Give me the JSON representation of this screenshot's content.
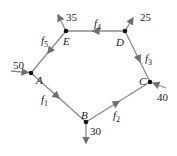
{
  "diagram": {
    "type": "flow-network",
    "nodes": [
      {
        "id": "A",
        "label": "A"
      },
      {
        "id": "B",
        "label": "B"
      },
      {
        "id": "C",
        "label": "C"
      },
      {
        "id": "D",
        "label": "D"
      },
      {
        "id": "E",
        "label": "E"
      }
    ],
    "edges": [
      {
        "from": "A",
        "to": "B",
        "label": "f",
        "sub": "1"
      },
      {
        "from": "B",
        "to": "C",
        "label": "f",
        "sub": "2"
      },
      {
        "from": "D",
        "to": "C",
        "label": "f",
        "sub": "3"
      },
      {
        "from": "D",
        "to": "E",
        "label": "f",
        "sub": "4"
      },
      {
        "from": "E",
        "to": "A",
        "label": "f",
        "sub": "5"
      }
    ],
    "external_flows": [
      {
        "node": "A",
        "value": "50",
        "direction": "in"
      },
      {
        "node": "E",
        "value": "35",
        "direction": "out"
      },
      {
        "node": "D",
        "value": "25",
        "direction": "out"
      },
      {
        "node": "C",
        "value": "40",
        "direction": "in"
      },
      {
        "node": "B",
        "value": "30",
        "direction": "out"
      }
    ],
    "colors": {
      "edge": "#8a8a8a",
      "node": "#111111",
      "text": "#222222"
    }
  }
}
